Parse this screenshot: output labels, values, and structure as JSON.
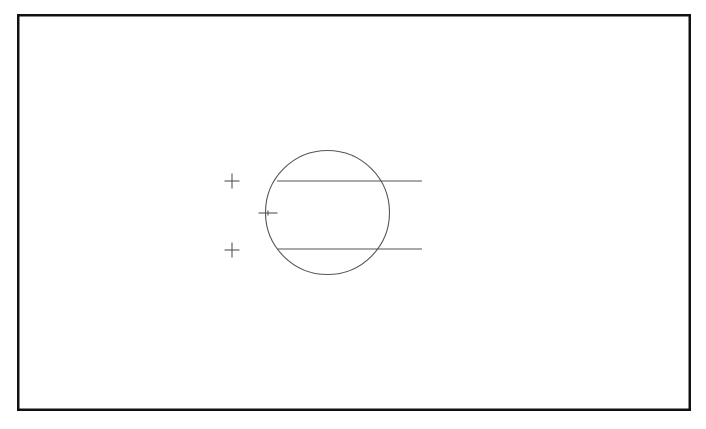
{
  "canvas": {
    "width": 706,
    "height": 429,
    "background_color": "#ffffff"
  },
  "frame": {
    "name": "page-border",
    "x": 17,
    "y": 14,
    "width": 674,
    "height": 397,
    "stroke_color": "#111111",
    "stroke_width": 2.5,
    "fill": "#ffffff"
  },
  "figure": {
    "title": "",
    "caption": "",
    "stroke_color": "#55555c",
    "stroke_width": 1.1,
    "circle": {
      "name": "circle-outline",
      "center_x": 327.5,
      "center_y": 212.5,
      "radius": 62,
      "fill": "none"
    },
    "lines": [
      {
        "name": "upper-chord-line",
        "x1": 277,
        "y1": 181,
        "x2": 422,
        "y2": 181
      },
      {
        "name": "lower-chord-line",
        "x1": 278,
        "y1": 249,
        "x2": 422,
        "y2": 249
      }
    ],
    "markers": [
      {
        "name": "plus-marker-top",
        "type": "plus",
        "center_x": 232,
        "center_y": 181,
        "arm_horizontal": 15,
        "arm_vertical": 15
      },
      {
        "name": "tick-marker-middle",
        "type": "cross-small",
        "center_x": 268,
        "center_y": 213,
        "arm_horizontal": 19,
        "arm_vertical": 5
      },
      {
        "name": "plus-marker-bottom",
        "type": "plus",
        "center_x": 232,
        "center_y": 250,
        "arm_horizontal": 15,
        "arm_vertical": 15
      }
    ]
  }
}
